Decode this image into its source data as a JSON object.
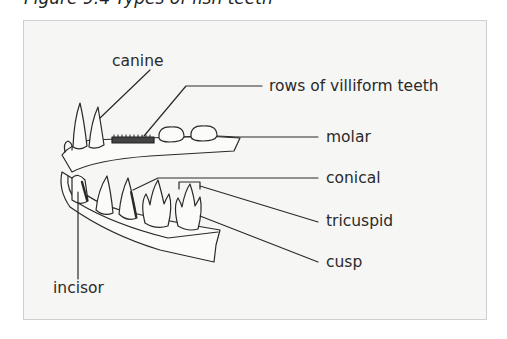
{
  "caption": "Figure 9.4  Types of fish teeth",
  "diagram": {
    "labels": {
      "canine": "canine",
      "villiform": "rows of villiform teeth",
      "molar": "molar",
      "conical": "conical",
      "tricuspid": "tricuspid",
      "cusp": "cusp",
      "incisor": "incisor"
    }
  },
  "colors": {
    "background": "#f6f6f5",
    "border": "#cfcfcf",
    "ink": "#2a2a2a"
  }
}
